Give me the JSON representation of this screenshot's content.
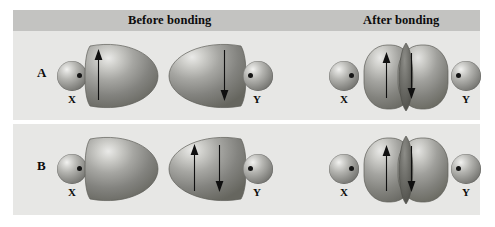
{
  "figure": {
    "background_color": "#ffffff",
    "panel_color": "#e7e7e5",
    "header_band_color": "#c3c3c1",
    "divider_color": "#ffffff",
    "orbital_fill": "#8a8a86",
    "arrow_color": "#101010",
    "text_color": "#0c0c0c"
  },
  "headers": {
    "before": "Before bonding",
    "after": "After bonding"
  },
  "rows": [
    {
      "id": "A",
      "label": "A",
      "before": {
        "left_group": {
          "atom_label": "X",
          "electron_dot": "right",
          "orbital_direction": "right",
          "arrows": [
            "up"
          ]
        },
        "right_group": {
          "atom_label": "Y",
          "electron_dot": "left",
          "orbital_direction": "left",
          "arrows": [
            "down"
          ]
        }
      },
      "after": {
        "left_atom_label": "X",
        "left_electron_dot": "right",
        "right_atom_label": "Y",
        "right_electron_dot": "left",
        "arrows": [
          "up",
          "down"
        ],
        "overlap": "true"
      }
    },
    {
      "id": "B",
      "label": "B",
      "before": {
        "left_group": {
          "atom_label": "X",
          "electron_dot": "right",
          "orbital_direction": "right",
          "arrows": []
        },
        "right_group": {
          "atom_label": "Y",
          "electron_dot": "left",
          "orbital_direction": "left",
          "arrows": [
            "up",
            "down"
          ]
        }
      },
      "after": {
        "left_atom_label": "X",
        "left_electron_dot": "right",
        "right_atom_label": "Y",
        "right_electron_dot": "left",
        "arrows": [
          "up",
          "down"
        ],
        "overlap": "true"
      }
    }
  ]
}
